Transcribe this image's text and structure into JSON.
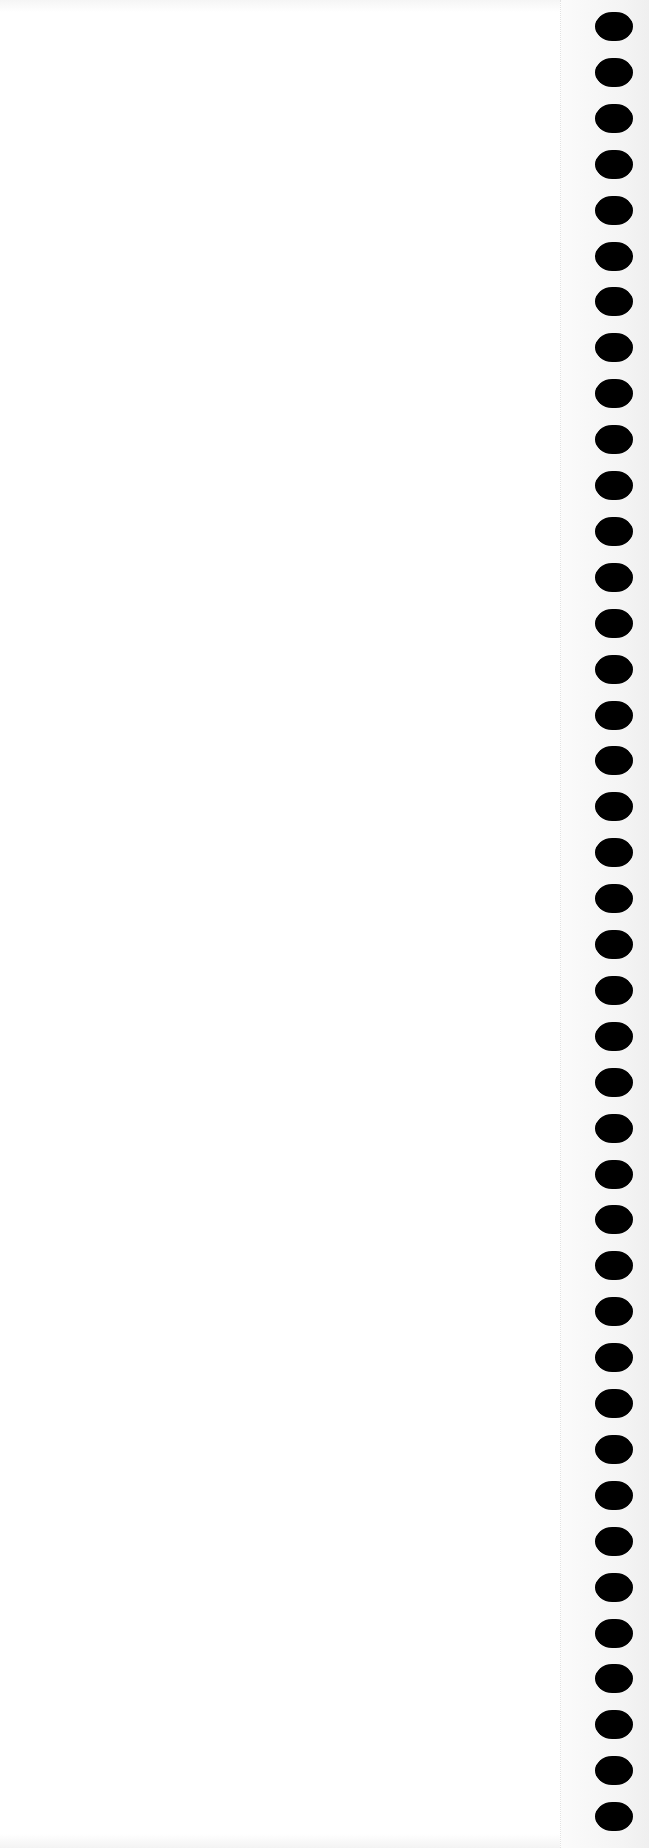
{
  "page": {
    "type": "blank notebook page",
    "background_color": "#ffffff",
    "text_content": ""
  },
  "binding": {
    "hole_count": 40,
    "hole_color": "#000000",
    "hole_left_px": 595,
    "hole_width_px": 38,
    "hole_height_px": 29,
    "first_hole_top_px": 12,
    "hole_pitch_px": 45.9,
    "perforation_line_x_px": 560
  }
}
